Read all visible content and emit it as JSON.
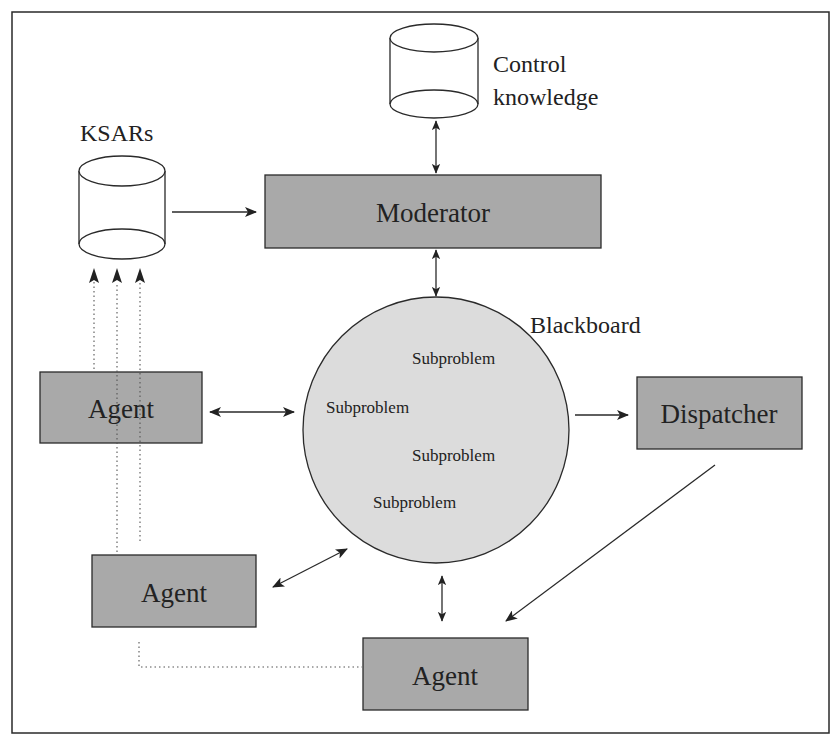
{
  "diagram": {
    "colors": {
      "box_fill": "#a9a9a9",
      "circle_fill": "#dcdcdc",
      "stroke": "#2a2a2a",
      "background": "#ffffff"
    },
    "stores": {
      "control_knowledge": {
        "line1": "Control",
        "line2": "knowledge"
      },
      "ksars": {
        "label": "KSARs"
      }
    },
    "nodes": {
      "moderator": {
        "label": "Moderator"
      },
      "blackboard": {
        "label": "Blackboard",
        "items": [
          "Subproblem",
          "Subproblem",
          "Subproblem",
          "Subproblem"
        ]
      },
      "dispatcher": {
        "label": "Dispatcher"
      },
      "agent_1": {
        "label": "Agent"
      },
      "agent_2": {
        "label": "Agent"
      },
      "agent_3": {
        "label": "Agent"
      }
    },
    "edges": [
      {
        "from": "control_knowledge",
        "to": "moderator",
        "type": "bidirectional"
      },
      {
        "from": "ksars",
        "to": "moderator",
        "type": "directed"
      },
      {
        "from": "moderator",
        "to": "blackboard",
        "type": "bidirectional"
      },
      {
        "from": "agent_1",
        "to": "blackboard",
        "type": "bidirectional"
      },
      {
        "from": "agent_2",
        "to": "blackboard",
        "type": "bidirectional"
      },
      {
        "from": "agent_3",
        "to": "blackboard",
        "type": "bidirectional"
      },
      {
        "from": "blackboard",
        "to": "dispatcher",
        "type": "directed"
      },
      {
        "from": "dispatcher",
        "to": "agent_3",
        "type": "directed"
      },
      {
        "from": "agent_1",
        "to": "ksars",
        "type": "dotted-directed"
      },
      {
        "from": "agent_2",
        "to": "ksars",
        "type": "dotted-directed"
      },
      {
        "from": "agent_3",
        "to": "ksars",
        "type": "dotted-directed"
      }
    ]
  }
}
